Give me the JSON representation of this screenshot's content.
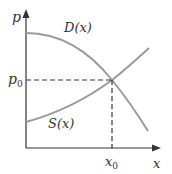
{
  "diagram": {
    "axes": {
      "y_label": "p",
      "x_label": "x"
    },
    "curves": [
      {
        "name": "demand",
        "label": "D(x)",
        "shape": "decreasing, concave down"
      },
      {
        "name": "supply",
        "label": "S(x)",
        "shape": "increasing, concave up"
      }
    ],
    "equilibrium": {
      "price_label": "p",
      "price_subscript": "0",
      "quantity_label": "x",
      "quantity_subscript": "0"
    },
    "colors": {
      "axis": "#333333",
      "curve": "#9a9a9a",
      "guide": "#333333",
      "text": "#333333"
    }
  }
}
